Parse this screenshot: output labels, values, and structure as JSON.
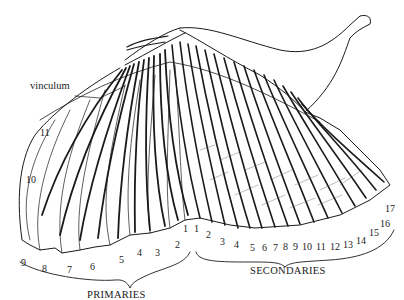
{
  "diagram": {
    "colors": {
      "ink": "#1a1a1a",
      "background": "#ffffff"
    },
    "labels": {
      "vinculum": "vinculum",
      "primaries_caption": "PRIMARIES",
      "secondaries_caption": "SECONDARIES"
    },
    "primaries": [
      {
        "n": "11",
        "x": 40,
        "y": 128
      },
      {
        "n": "10",
        "x": 26,
        "y": 175
      },
      {
        "n": "9",
        "x": 21,
        "y": 258
      },
      {
        "n": "8",
        "x": 42,
        "y": 264
      },
      {
        "n": "7",
        "x": 67,
        "y": 265
      },
      {
        "n": "6",
        "x": 90,
        "y": 262
      },
      {
        "n": "5",
        "x": 119,
        "y": 255
      },
      {
        "n": "4",
        "x": 137,
        "y": 248
      },
      {
        "n": "3",
        "x": 155,
        "y": 248
      },
      {
        "n": "2",
        "x": 175,
        "y": 240
      },
      {
        "n": "1",
        "x": 183,
        "y": 224
      }
    ],
    "secondaries": [
      {
        "n": "1",
        "x": 194,
        "y": 224
      },
      {
        "n": "2",
        "x": 206,
        "y": 230
      },
      {
        "n": "3",
        "x": 220,
        "y": 237
      },
      {
        "n": "4",
        "x": 234,
        "y": 240
      },
      {
        "n": "5",
        "x": 250,
        "y": 243
      },
      {
        "n": "6",
        "x": 262,
        "y": 243
      },
      {
        "n": "7",
        "x": 273,
        "y": 243
      },
      {
        "n": "8",
        "x": 283,
        "y": 242
      },
      {
        "n": "9",
        "x": 293,
        "y": 242
      },
      {
        "n": "10",
        "x": 302,
        "y": 242
      },
      {
        "n": "11",
        "x": 316,
        "y": 242
      },
      {
        "n": "12",
        "x": 330,
        "y": 242
      },
      {
        "n": "13",
        "x": 343,
        "y": 240
      },
      {
        "n": "14",
        "x": 356,
        "y": 236
      },
      {
        "n": "15",
        "x": 369,
        "y": 228
      },
      {
        "n": "16",
        "x": 380,
        "y": 219
      },
      {
        "n": "17",
        "x": 385,
        "y": 204
      }
    ]
  }
}
